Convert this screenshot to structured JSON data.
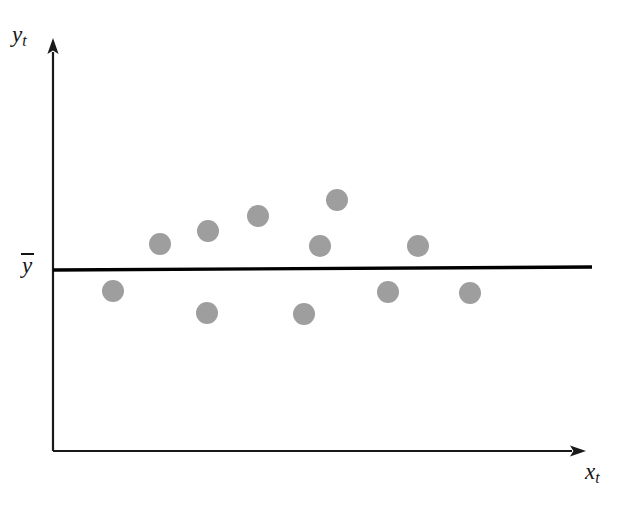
{
  "figure": {
    "title": "",
    "background_color": "#ffffff",
    "width": 630,
    "height": 507
  },
  "labels": {
    "y_axis": "y",
    "y_axis_subscript": "t",
    "x_axis": "x",
    "x_axis_subscript": "t",
    "mean_line": "y",
    "mean_line_overbar": true
  },
  "style": {
    "marker_color": "#9e9e9e",
    "axis_color": "#1a1a1a",
    "mean_line_color": "#000000",
    "marker_radius": 11,
    "axis_stroke_width": 2.2,
    "mean_line_stroke_width": 3.4
  },
  "chart_data": {
    "type": "scatter",
    "title": "",
    "xlabel": "x_t",
    "ylabel": "y_t",
    "grid": false,
    "legend": false,
    "xlim": [
      0,
      1
    ],
    "ylim": [
      0,
      1
    ],
    "annotations": [
      {
        "name": "mean-line",
        "label": "y-bar",
        "type": "horizontal-line",
        "y_value": 0.5,
        "x_start": 0.0,
        "x_end": 1.0,
        "note": "Sample mean of y_t; scatter is randomly distributed about it with no trend"
      }
    ],
    "series": [
      {
        "name": "observations",
        "color": "#9e9e9e",
        "marker": "circle",
        "points": [
          {
            "id": 1,
            "x": 0.111,
            "y": 0.635,
            "px": 113,
            "py": 291,
            "side": "below"
          },
          {
            "id": 2,
            "x": 0.198,
            "y": 0.759,
            "px": 160,
            "py": 244,
            "side": "above"
          },
          {
            "id": 3,
            "x": 0.286,
            "y": 0.788,
            "px": 208,
            "py": 231,
            "side": "above"
          },
          {
            "id": 4,
            "x": 0.285,
            "y": 0.578,
            "px": 207,
            "py": 313,
            "side": "below"
          },
          {
            "id": 5,
            "x": 0.38,
            "y": 0.826,
            "px": 258,
            "py": 216,
            "side": "above"
          },
          {
            "id": 6,
            "x": 0.495,
            "y": 0.573,
            "px": 304,
            "py": 314,
            "side": "below"
          },
          {
            "id": 7,
            "x": 0.495,
            "y": 0.751,
            "px": 320,
            "py": 246,
            "side": "above"
          },
          {
            "id": 8,
            "x": 0.527,
            "y": 0.867,
            "px": 337,
            "py": 200,
            "side": "above"
          },
          {
            "id": 9,
            "x": 0.622,
            "y": 0.632,
            "px": 388,
            "py": 292,
            "side": "below"
          },
          {
            "id": 10,
            "x": 0.676,
            "y": 0.751,
            "px": 418,
            "py": 246,
            "side": "above"
          },
          {
            "id": 11,
            "x": 0.773,
            "y": 0.629,
            "px": 470,
            "py": 293,
            "side": "below"
          }
        ]
      }
    ]
  },
  "geometry": {
    "y_axis": {
      "x": 53,
      "y_top": 40,
      "y_bottom": 451
    },
    "x_axis": {
      "y": 451,
      "x_left": 53,
      "x_right": 584
    },
    "mean_line": {
      "x_start": 53,
      "y_start": 270,
      "x_end": 592,
      "y_end": 267
    }
  }
}
